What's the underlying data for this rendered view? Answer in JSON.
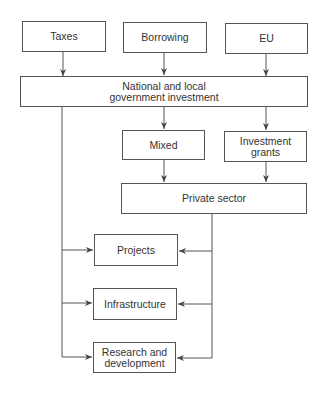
{
  "diagram": {
    "sources": [
      {
        "id": "taxes",
        "label": "Taxes"
      },
      {
        "id": "borrowing",
        "label": "Borrowing"
      },
      {
        "id": "eu",
        "label": "EU"
      }
    ],
    "government": {
      "label_line1": "National and local",
      "label_line2": "government investment"
    },
    "intermediate": [
      {
        "id": "mixed",
        "label": "Mixed"
      },
      {
        "id": "investment-grants",
        "label_line1": "Investment",
        "label_line2": "grants"
      }
    ],
    "private": {
      "label": "Private sector"
    },
    "outcomes": [
      {
        "id": "projects",
        "label": "Projects"
      },
      {
        "id": "infrastructure",
        "label": "Infrastructure"
      },
      {
        "id": "rnd",
        "label_line1": "Research and",
        "label_line2": "development"
      }
    ],
    "colors": {
      "line": "#555555",
      "text": "#333333",
      "background": "#ffffff"
    }
  }
}
